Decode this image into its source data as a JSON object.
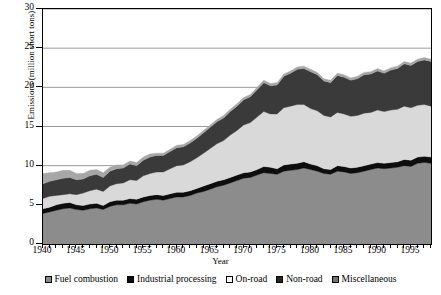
{
  "chart_data": {
    "type": "area",
    "stacked": true,
    "title": "",
    "xlabel": "Year",
    "ylabel": "Emissions (million short tons)",
    "xlim": [
      1940,
      1998
    ],
    "ylim": [
      0,
      30
    ],
    "ytick_labels": [
      "0",
      "5",
      "10",
      "15",
      "20",
      "25",
      "30"
    ],
    "ytick_values": [
      0,
      5,
      10,
      15,
      20,
      25,
      30
    ],
    "xtick_labels": [
      "1940",
      "1945",
      "1950",
      "1955",
      "1960",
      "1965",
      "1970",
      "1975",
      "1980",
      "1985",
      "1990",
      "1995"
    ],
    "xtick_values": [
      1940,
      1945,
      1950,
      1955,
      1960,
      1965,
      1970,
      1975,
      1980,
      1985,
      1990,
      1995
    ],
    "minor_xticks_every": 1,
    "grid": "horizontal",
    "legend_position": "bottom",
    "x": [
      1940,
      1941,
      1942,
      1943,
      1944,
      1945,
      1946,
      1947,
      1948,
      1949,
      1950,
      1951,
      1952,
      1953,
      1954,
      1955,
      1956,
      1957,
      1958,
      1959,
      1960,
      1961,
      1962,
      1963,
      1964,
      1965,
      1966,
      1967,
      1968,
      1969,
      1970,
      1971,
      1972,
      1973,
      1974,
      1975,
      1976,
      1977,
      1978,
      1979,
      1980,
      1981,
      1982,
      1983,
      1984,
      1985,
      1986,
      1987,
      1988,
      1989,
      1990,
      1991,
      1992,
      1993,
      1994,
      1995,
      1996,
      1997,
      1998
    ],
    "series": [
      {
        "name": "Fuel combustion",
        "color": "#8c8c8c",
        "swatch": "#8c8c8c",
        "values": [
          3.9,
          4.1,
          4.3,
          4.5,
          4.6,
          4.4,
          4.3,
          4.5,
          4.6,
          4.4,
          4.8,
          5.0,
          5.0,
          5.2,
          5.1,
          5.4,
          5.6,
          5.7,
          5.6,
          5.8,
          6.0,
          6.0,
          6.2,
          6.5,
          6.7,
          7.0,
          7.3,
          7.5,
          7.8,
          8.1,
          8.4,
          8.5,
          8.8,
          9.1,
          9.0,
          8.9,
          9.3,
          9.4,
          9.5,
          9.7,
          9.5,
          9.3,
          9.0,
          8.9,
          9.3,
          9.2,
          9.0,
          9.1,
          9.3,
          9.5,
          9.7,
          9.6,
          9.7,
          9.8,
          10.0,
          9.9,
          10.3,
          10.4,
          10.3
        ]
      },
      {
        "name": "Industrial processing",
        "color": "#0d0d0d",
        "swatch": "#0d0d0d",
        "values": [
          0.6,
          0.6,
          0.7,
          0.7,
          0.7,
          0.6,
          0.6,
          0.6,
          0.6,
          0.5,
          0.6,
          0.6,
          0.6,
          0.6,
          0.6,
          0.6,
          0.6,
          0.6,
          0.6,
          0.6,
          0.6,
          0.6,
          0.6,
          0.6,
          0.7,
          0.7,
          0.7,
          0.7,
          0.7,
          0.7,
          0.7,
          0.7,
          0.7,
          0.8,
          0.8,
          0.7,
          0.8,
          0.8,
          0.8,
          0.8,
          0.7,
          0.7,
          0.6,
          0.6,
          0.7,
          0.7,
          0.7,
          0.7,
          0.7,
          0.7,
          0.7,
          0.7,
          0.7,
          0.7,
          0.8,
          0.8,
          0.8,
          0.8,
          0.8
        ]
      },
      {
        "name": "On-road",
        "color": "#d9d9d9",
        "swatch": "#f7f7f7",
        "values": [
          1.3,
          1.4,
          1.2,
          1.1,
          1.1,
          1.3,
          1.6,
          1.7,
          1.8,
          1.8,
          2.0,
          2.1,
          2.2,
          2.4,
          2.4,
          2.7,
          2.8,
          2.9,
          3.0,
          3.2,
          3.4,
          3.5,
          3.7,
          3.9,
          4.2,
          4.5,
          4.8,
          5.0,
          5.4,
          5.7,
          6.1,
          6.3,
          6.7,
          7.0,
          6.8,
          7.0,
          7.3,
          7.4,
          7.5,
          7.3,
          7.1,
          7.0,
          6.8,
          6.7,
          6.8,
          6.7,
          6.6,
          6.6,
          6.7,
          6.6,
          6.7,
          6.6,
          6.7,
          6.7,
          6.8,
          6.7,
          6.6,
          6.6,
          6.5
        ]
      },
      {
        "name": "Non-road",
        "color": "#3a3a3a",
        "swatch": "#262626",
        "values": [
          1.9,
          1.9,
          2.0,
          2.1,
          2.1,
          1.9,
          1.8,
          1.9,
          1.9,
          1.8,
          1.9,
          1.9,
          1.9,
          2.0,
          1.9,
          2.0,
          2.1,
          2.1,
          2.1,
          2.2,
          2.3,
          2.3,
          2.4,
          2.5,
          2.6,
          2.7,
          2.8,
          2.9,
          3.0,
          3.1,
          3.2,
          3.3,
          3.5,
          3.7,
          3.6,
          3.7,
          4.0,
          4.2,
          4.5,
          4.6,
          4.7,
          4.6,
          4.4,
          4.4,
          4.7,
          4.7,
          4.6,
          4.7,
          4.9,
          4.9,
          5.0,
          4.9,
          5.1,
          5.2,
          5.4,
          5.4,
          5.6,
          5.7,
          5.7
        ]
      },
      {
        "name": "Miscellaneous",
        "color": "#a6a6a6",
        "swatch": "#737373",
        "values": [
          1.3,
          1.1,
          1.0,
          1.0,
          0.9,
          0.8,
          0.7,
          0.7,
          0.6,
          0.6,
          0.5,
          0.5,
          0.4,
          0.4,
          0.4,
          0.4,
          0.4,
          0.3,
          0.3,
          0.3,
          0.3,
          0.3,
          0.3,
          0.3,
          0.3,
          0.3,
          0.3,
          0.3,
          0.3,
          0.3,
          0.3,
          0.3,
          0.3,
          0.3,
          0.3,
          0.3,
          0.3,
          0.3,
          0.3,
          0.3,
          0.3,
          0.3,
          0.3,
          0.3,
          0.3,
          0.3,
          0.3,
          0.3,
          0.3,
          0.3,
          0.3,
          0.3,
          0.3,
          0.3,
          0.3,
          0.3,
          0.3,
          0.3,
          0.3
        ]
      }
    ]
  }
}
